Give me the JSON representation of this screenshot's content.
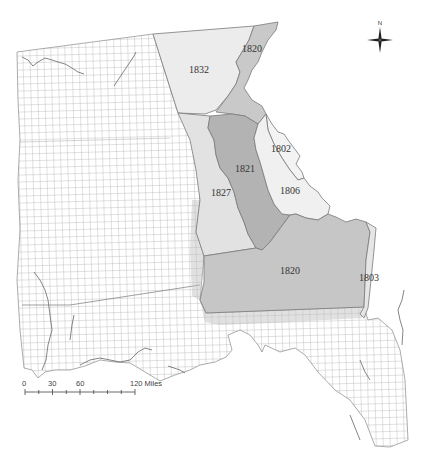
{
  "map": {
    "regions": [
      {
        "id": "r1832",
        "label": "1832",
        "fill": "#ececec",
        "label_x": 199,
        "label_y": 73
      },
      {
        "id": "r1820n",
        "label": "1820",
        "fill": "#c9c9c9",
        "label_x": 252,
        "label_y": 52
      },
      {
        "id": "r1821",
        "label": "1821",
        "fill": "#b3b3b3",
        "label_x": 245,
        "label_y": 172
      },
      {
        "id": "r1827",
        "label": "1827",
        "fill": "#e2e2e2",
        "label_x": 221,
        "label_y": 196
      },
      {
        "id": "r1802",
        "label": "1802",
        "fill": "#f3f3f3",
        "label_x": 281,
        "label_y": 152
      },
      {
        "id": "r1806",
        "label": "1806",
        "fill": "#f0f0f0",
        "label_x": 290,
        "label_y": 194
      },
      {
        "id": "r1820s",
        "label": "1820",
        "fill": "#c6c6c6",
        "label_x": 290,
        "label_y": 274
      },
      {
        "id": "r1803",
        "label": "1803",
        "fill": "#e6e6e6",
        "label_x": 369,
        "label_y": 281
      }
    ],
    "compass": {
      "label": "N"
    },
    "scale_bar": {
      "ticks": [
        "0",
        "30",
        "60",
        "120 Miles"
      ],
      "unit": "Miles"
    },
    "colors": {
      "grid_line": "#9a9a9a",
      "boundary": "#7a7a7a",
      "coast": "#555555",
      "background": "#ffffff"
    }
  }
}
